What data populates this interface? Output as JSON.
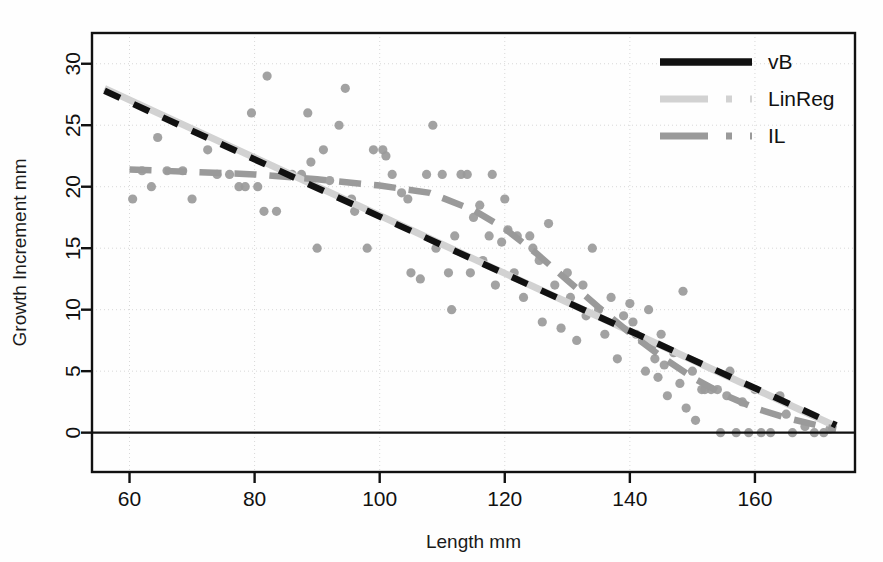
{
  "chart_data": {
    "type": "scatter",
    "title": "",
    "xlabel": "Length mm",
    "ylabel": "Growth Increment mm",
    "xlim": [
      54,
      176
    ],
    "ylim": [
      -3.2,
      32.5
    ],
    "xticks": [
      60,
      80,
      100,
      120,
      140,
      160
    ],
    "yticks": [
      0,
      5,
      10,
      15,
      20,
      25,
      30
    ],
    "grid": true,
    "grid_style": "dotted",
    "legend_position": "top-right",
    "point_color": "#9a9a9a",
    "points": [
      {
        "x": 60.5,
        "y": 19.0
      },
      {
        "x": 62.0,
        "y": 21.3
      },
      {
        "x": 63.5,
        "y": 20.0
      },
      {
        "x": 64.5,
        "y": 24.0
      },
      {
        "x": 66.0,
        "y": 21.3
      },
      {
        "x": 68.5,
        "y": 21.3
      },
      {
        "x": 70.0,
        "y": 19.0
      },
      {
        "x": 72.5,
        "y": 23.0
      },
      {
        "x": 74.0,
        "y": 21.0
      },
      {
        "x": 76.0,
        "y": 21.0
      },
      {
        "x": 77.5,
        "y": 20.0
      },
      {
        "x": 78.5,
        "y": 20.0
      },
      {
        "x": 79.5,
        "y": 26.0
      },
      {
        "x": 80.5,
        "y": 20.0
      },
      {
        "x": 81.5,
        "y": 18.0
      },
      {
        "x": 82.0,
        "y": 29.0
      },
      {
        "x": 83.5,
        "y": 18.0
      },
      {
        "x": 85.0,
        "y": 21.0
      },
      {
        "x": 86.0,
        "y": 21.0
      },
      {
        "x": 87.5,
        "y": 21.0
      },
      {
        "x": 88.5,
        "y": 26.0
      },
      {
        "x": 89.0,
        "y": 22.0
      },
      {
        "x": 90.0,
        "y": 15.0
      },
      {
        "x": 91.0,
        "y": 23.0
      },
      {
        "x": 92.0,
        "y": 20.5
      },
      {
        "x": 93.5,
        "y": 25.0
      },
      {
        "x": 94.5,
        "y": 28.0
      },
      {
        "x": 95.5,
        "y": 19.0
      },
      {
        "x": 96.0,
        "y": 18.0
      },
      {
        "x": 98.0,
        "y": 15.0
      },
      {
        "x": 99.0,
        "y": 23.0
      },
      {
        "x": 100.5,
        "y": 23.0
      },
      {
        "x": 101.0,
        "y": 22.5
      },
      {
        "x": 102.0,
        "y": 21.0
      },
      {
        "x": 103.5,
        "y": 19.5
      },
      {
        "x": 104.5,
        "y": 19.0
      },
      {
        "x": 105.0,
        "y": 13.0
      },
      {
        "x": 106.5,
        "y": 12.5
      },
      {
        "x": 107.5,
        "y": 21.0
      },
      {
        "x": 108.5,
        "y": 25.0
      },
      {
        "x": 109.0,
        "y": 15.0
      },
      {
        "x": 110.0,
        "y": 21.0
      },
      {
        "x": 111.0,
        "y": 13.0
      },
      {
        "x": 111.5,
        "y": 10.0
      },
      {
        "x": 112.0,
        "y": 16.0
      },
      {
        "x": 113.0,
        "y": 21.0
      },
      {
        "x": 114.0,
        "y": 21.0
      },
      {
        "x": 114.5,
        "y": 13.0
      },
      {
        "x": 115.0,
        "y": 17.5
      },
      {
        "x": 116.0,
        "y": 18.5
      },
      {
        "x": 116.5,
        "y": 14.0
      },
      {
        "x": 117.5,
        "y": 16.0
      },
      {
        "x": 118.0,
        "y": 21.0
      },
      {
        "x": 118.5,
        "y": 12.0
      },
      {
        "x": 119.5,
        "y": 15.5
      },
      {
        "x": 120.0,
        "y": 19.0
      },
      {
        "x": 120.5,
        "y": 16.5
      },
      {
        "x": 121.5,
        "y": 13.0
      },
      {
        "x": 122.0,
        "y": 16.0
      },
      {
        "x": 123.0,
        "y": 11.0
      },
      {
        "x": 124.0,
        "y": 16.0
      },
      {
        "x": 124.5,
        "y": 15.0
      },
      {
        "x": 125.5,
        "y": 14.0
      },
      {
        "x": 126.0,
        "y": 9.0
      },
      {
        "x": 127.0,
        "y": 17.0
      },
      {
        "x": 128.0,
        "y": 12.0
      },
      {
        "x": 129.0,
        "y": 8.5
      },
      {
        "x": 130.0,
        "y": 13.0
      },
      {
        "x": 130.5,
        "y": 11.0
      },
      {
        "x": 131.5,
        "y": 7.5
      },
      {
        "x": 132.5,
        "y": 12.0
      },
      {
        "x": 133.0,
        "y": 9.5
      },
      {
        "x": 134.0,
        "y": 15.0
      },
      {
        "x": 135.0,
        "y": 10.0
      },
      {
        "x": 136.0,
        "y": 8.0
      },
      {
        "x": 137.0,
        "y": 11.0
      },
      {
        "x": 138.0,
        "y": 6.0
      },
      {
        "x": 139.0,
        "y": 9.5
      },
      {
        "x": 140.0,
        "y": 10.5
      },
      {
        "x": 140.5,
        "y": 9.0
      },
      {
        "x": 141.0,
        "y": 8.0
      },
      {
        "x": 142.0,
        "y": 7.5
      },
      {
        "x": 142.5,
        "y": 5.0
      },
      {
        "x": 143.0,
        "y": 10.0
      },
      {
        "x": 143.5,
        "y": 7.0
      },
      {
        "x": 144.0,
        "y": 6.0
      },
      {
        "x": 144.5,
        "y": 4.5
      },
      {
        "x": 145.0,
        "y": 8.0
      },
      {
        "x": 145.5,
        "y": 5.5
      },
      {
        "x": 146.0,
        "y": 3.0
      },
      {
        "x": 147.0,
        "y": 6.5
      },
      {
        "x": 148.0,
        "y": 4.0
      },
      {
        "x": 148.5,
        "y": 11.5
      },
      {
        "x": 149.0,
        "y": 2.0
      },
      {
        "x": 150.0,
        "y": 5.0
      },
      {
        "x": 150.5,
        "y": 1.0
      },
      {
        "x": 151.5,
        "y": 3.5
      },
      {
        "x": 152.0,
        "y": 3.5
      },
      {
        "x": 153.0,
        "y": 3.5
      },
      {
        "x": 154.0,
        "y": 3.5
      },
      {
        "x": 154.5,
        "y": 0.0
      },
      {
        "x": 155.5,
        "y": 3.0
      },
      {
        "x": 156.0,
        "y": 5.0
      },
      {
        "x": 157.0,
        "y": 0.0
      },
      {
        "x": 158.0,
        "y": 2.5
      },
      {
        "x": 159.0,
        "y": 0.0
      },
      {
        "x": 160.0,
        "y": 3.5
      },
      {
        "x": 161.0,
        "y": 0.0
      },
      {
        "x": 162.5,
        "y": 0.0
      },
      {
        "x": 164.0,
        "y": 3.0
      },
      {
        "x": 165.0,
        "y": 1.5
      },
      {
        "x": 166.0,
        "y": 0.0
      },
      {
        "x": 168.0,
        "y": 0.5
      },
      {
        "x": 169.5,
        "y": 0.0
      },
      {
        "x": 171.0,
        "y": 0.0
      },
      {
        "x": 172.0,
        "y": 0.3
      }
    ],
    "series": [
      {
        "name": "vB",
        "style": "solid",
        "color": "#111111",
        "points": [
          {
            "x": 56.0,
            "y": 27.8
          },
          {
            "x": 173.0,
            "y": 0.6
          }
        ]
      },
      {
        "name": "LinReg",
        "style": "dash-dot",
        "color": "#d2d2d2",
        "points": [
          {
            "x": 56.0,
            "y": 28.0
          },
          {
            "x": 173.0,
            "y": 0.5
          }
        ]
      },
      {
        "name": "IL",
        "style": "dash-dot",
        "color": "#9a9a9a",
        "points": [
          {
            "x": 60.0,
            "y": 21.4
          },
          {
            "x": 70.0,
            "y": 21.2
          },
          {
            "x": 80.0,
            "y": 21.0
          },
          {
            "x": 90.0,
            "y": 20.6
          },
          {
            "x": 100.0,
            "y": 20.1
          },
          {
            "x": 108.0,
            "y": 19.5
          },
          {
            "x": 115.0,
            "y": 18.1
          },
          {
            "x": 120.0,
            "y": 16.6
          },
          {
            "x": 125.0,
            "y": 14.6
          },
          {
            "x": 130.0,
            "y": 12.4
          },
          {
            "x": 135.0,
            "y": 10.2
          },
          {
            "x": 140.0,
            "y": 8.1
          },
          {
            "x": 145.0,
            "y": 6.2
          },
          {
            "x": 150.0,
            "y": 4.5
          },
          {
            "x": 155.0,
            "y": 3.1
          },
          {
            "x": 160.0,
            "y": 2.0
          },
          {
            "x": 165.0,
            "y": 1.2
          },
          {
            "x": 170.0,
            "y": 0.6
          },
          {
            "x": 173.0,
            "y": 0.3
          }
        ]
      }
    ],
    "legend": [
      {
        "label": "vB",
        "style": "solid",
        "color": "#111111"
      },
      {
        "label": "LinReg",
        "style": "dash-dot",
        "color": "#d2d2d2"
      },
      {
        "label": "IL",
        "style": "dash-dot",
        "color": "#9a9a9a"
      }
    ],
    "zero_line": {
      "value": 0,
      "color": "#111111"
    }
  }
}
